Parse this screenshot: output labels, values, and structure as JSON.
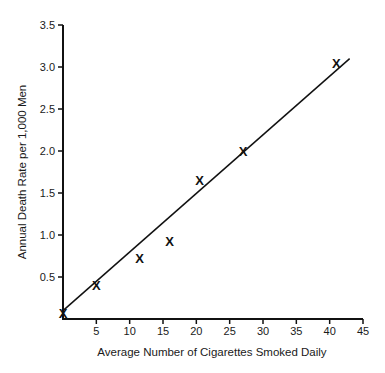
{
  "chart_data": {
    "type": "scatter",
    "title": "",
    "xlabel": "Average Number of Cigarettes Smoked Daily",
    "ylabel": "Annual Death Rate per 1,000 Men",
    "xlim": [
      0,
      45
    ],
    "ylim": [
      0,
      3.5
    ],
    "grid": false,
    "legend": null,
    "x_ticks": [
      5,
      10,
      15,
      20,
      25,
      30,
      35,
      40,
      45
    ],
    "x_tick_labels": [
      "5",
      "10",
      "15",
      "20",
      "25",
      "30",
      "35",
      "40",
      "45"
    ],
    "y_ticks": [
      0.5,
      1.0,
      1.5,
      2.0,
      2.5,
      3.0,
      3.5
    ],
    "y_tick_labels": [
      "0.5",
      "1.0",
      "1.5",
      "2.0",
      "2.5",
      "3.0",
      "3.5"
    ],
    "marker": "X",
    "series": [
      {
        "name": "Observed",
        "type": "scatter",
        "x": [
          0,
          5,
          11.5,
          16,
          20.5,
          27,
          41
        ],
        "y": [
          0.07,
          0.4,
          0.73,
          0.93,
          1.65,
          2.0,
          3.05
        ]
      },
      {
        "name": "Fitted line",
        "type": "line",
        "x": [
          0,
          43
        ],
        "y": [
          0.1,
          3.1
        ]
      }
    ]
  }
}
